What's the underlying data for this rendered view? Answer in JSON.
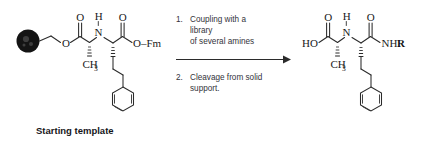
{
  "figure": {
    "background": "#ffffff",
    "bond_color": "#2b2b2b",
    "text_color": "#33333a",
    "bead_color": "#141414",
    "caption": "Starting template"
  },
  "reactant": {
    "name": "resin-bound-Fm-ester-dipeptide",
    "labels": {
      "bead": "solid-support-resin-bead",
      "ester_oxygen": "O",
      "carbonyl_oxygen_1": "O",
      "methyl": "CH",
      "methyl_sub": "3",
      "amide_nitrogen": "N",
      "amide_hydrogen": "H",
      "carbonyl_oxygen_2": "O",
      "fm_ester": "O–Fm"
    }
  },
  "conditions": {
    "steps": [
      {
        "number": "1.",
        "lines": [
          "Coupling with a",
          "library",
          "of several amines"
        ]
      },
      {
        "number": "2.",
        "lines": [
          "Cleavage from solid",
          "support."
        ]
      }
    ],
    "arrow": "reaction-arrow-right"
  },
  "product": {
    "name": "free-acid-amide-product",
    "labels": {
      "hydroxyl": "HO",
      "carbonyl_oxygen_1": "O",
      "methyl": "CH",
      "methyl_sub": "3",
      "amide_nitrogen": "N",
      "amide_hydrogen": "H",
      "carbonyl_oxygen_2": "O",
      "amide_terminus": "NH",
      "amide_r_group": "R"
    }
  }
}
